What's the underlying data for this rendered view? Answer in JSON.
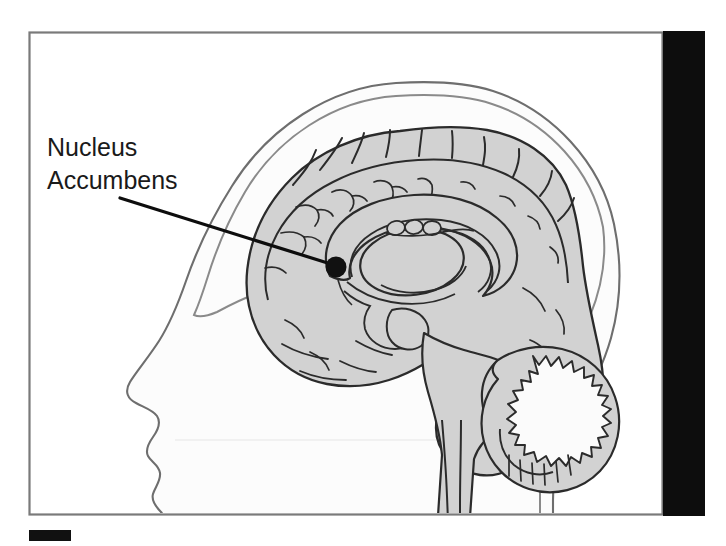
{
  "figure": {
    "type": "anatomical-illustration",
    "view": "mid-sagittal section of human brain within head profile"
  },
  "annotation": {
    "label_line1": "Nucleus",
    "label_line2": "Accumbens",
    "leader_line": {
      "from_x": 120,
      "from_y": 198,
      "to_x": 332,
      "to_y": 264
    },
    "marker": {
      "name": "nucleus-accumbens-marker",
      "cx": 336,
      "cy": 267,
      "r": 10,
      "color": "#111111"
    }
  },
  "colors": {
    "background": "#ffffff",
    "frame_border": "#7a7a7a",
    "head_outline": "#6e6e6e",
    "head_fill": "#fcfcfc",
    "brain_fill": "#d2d2d2",
    "brain_outline": "#2b2b2b",
    "cerebellum_fill": "#fbfbfb",
    "text": "#1a1a1a",
    "right_bar": "#0d0d0d",
    "corner_bar": "#111111"
  },
  "frame": {
    "name": "illustration-frame",
    "x": 29,
    "y": 32,
    "width": 634,
    "height": 483
  },
  "right_bar": {
    "name": "right-black-bar",
    "x": 663,
    "y": 31,
    "width": 42,
    "height": 485
  },
  "corner_bar": {
    "name": "bottom-left-black-bar",
    "x": 29,
    "y": 530,
    "width": 42,
    "height": 11
  },
  "structures": [
    {
      "name": "head-profile",
      "label": "Head profile outline"
    },
    {
      "name": "skull-outline",
      "label": "Skull / cranium outline"
    },
    {
      "name": "cerebral-cortex",
      "label": "Cerebral cortex with gyri and sulci"
    },
    {
      "name": "corpus-callosum",
      "label": "Corpus callosum"
    },
    {
      "name": "lateral-ventricle",
      "label": "Ventricle"
    },
    {
      "name": "thalamus",
      "label": "Thalamus"
    },
    {
      "name": "midbrain-colliculi",
      "label": "Colliculi"
    },
    {
      "name": "cerebellum",
      "label": "Cerebellum"
    },
    {
      "name": "brainstem",
      "label": "Brainstem"
    },
    {
      "name": "spinal-cord",
      "label": "Spinal cord"
    },
    {
      "name": "nucleus-accumbens",
      "label": "Nucleus Accumbens"
    }
  ]
}
